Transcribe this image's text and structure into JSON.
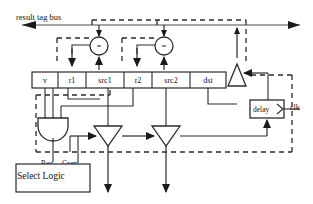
{
  "diagram": {
    "title": "result tag bus",
    "bus_label": "result tag bus",
    "clock_label": "clk",
    "delay_label": "delay",
    "select_logic_label": "Select Logic",
    "req_label": "Req",
    "grant_label": "Grant",
    "comparator_symbol": "=",
    "fields": [
      {
        "name": "v",
        "label": "v",
        "x": 32,
        "w": 26
      },
      {
        "name": "r1",
        "label": "r1",
        "x": 58,
        "w": 28
      },
      {
        "name": "src1",
        "label": "src1",
        "x": 86,
        "w": 38
      },
      {
        "name": "r2",
        "label": "r2",
        "x": 124,
        "w": 28
      },
      {
        "name": "src2",
        "label": "src2",
        "x": 152,
        "w": 38
      },
      {
        "name": "dst",
        "label": "dst",
        "x": 190,
        "w": 36
      }
    ],
    "comparators": [
      {
        "name": "comparator-1",
        "symbol": "=",
        "cx": 99,
        "cy": 46
      },
      {
        "name": "comparator-2",
        "symbol": "=",
        "cx": 164,
        "cy": 46
      }
    ],
    "colors": {
      "line": "#333333",
      "text": "#111111",
      "background": "#ffffff"
    }
  }
}
